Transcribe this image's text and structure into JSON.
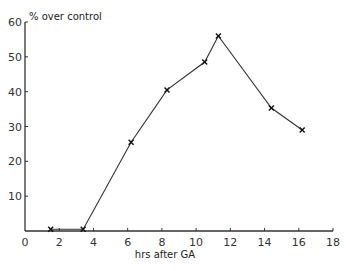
{
  "chart_data": {
    "type": "line",
    "title": "",
    "ylabel": "% over control",
    "xlabel": "hrs after GA",
    "xlim": [
      0,
      18
    ],
    "ylim": [
      0,
      60
    ],
    "x_ticks": [
      0,
      2,
      4,
      6,
      8,
      10,
      12,
      14,
      16,
      18
    ],
    "x_tick_labels": [
      "0",
      "2",
      "4",
      "6",
      "8",
      "10",
      "12",
      "14",
      "16",
      "18"
    ],
    "y_ticks": [
      10,
      20,
      30,
      40,
      50,
      60
    ],
    "y_tick_labels": [
      "10",
      "20",
      "30",
      "40",
      "50",
      "60"
    ],
    "grid": false,
    "legend": null,
    "marker": "x",
    "line_color": "#333333",
    "series": [
      {
        "name": "% over control",
        "x": [
          1.5,
          3.4,
          6.2,
          8.3,
          10.5,
          11.3,
          14.4,
          16.2
        ],
        "values": [
          0.5,
          0.5,
          25.5,
          40.5,
          48.5,
          56,
          35.3,
          29
        ]
      }
    ]
  }
}
